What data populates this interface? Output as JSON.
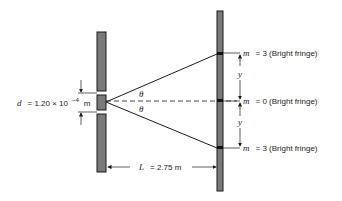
{
  "diagram": {
    "type": "double-slit interference",
    "colors": {
      "barrier_fill": "#7a7a7a",
      "stroke": "#1a1a1a",
      "background": "#ffffff"
    },
    "separation": {
      "symbol": "d",
      "equals": "= 1.20 × 10",
      "exponent": "−4",
      "unit": "m"
    },
    "distance": {
      "symbol": "L",
      "text": "= 2.75 m"
    },
    "angle_top": "θ",
    "angle_bottom": "θ",
    "y_top": "y",
    "y_bottom": "y",
    "fringes": [
      {
        "m_symbol": "m",
        "text": "= 3 (Bright fringe)"
      },
      {
        "m_symbol": "m",
        "text": "= 0 (Bright fringe)"
      },
      {
        "m_symbol": "m",
        "text": "= 3 (Bright fringe)"
      }
    ]
  }
}
